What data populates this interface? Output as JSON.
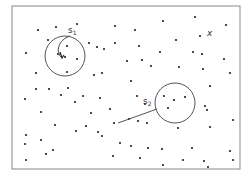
{
  "diagram": {
    "frame": {
      "x": 12,
      "y": 6,
      "width": 228,
      "height": 163
    },
    "colors": {
      "dot": "#222222",
      "line": "#777777",
      "background": "#ffffff"
    },
    "circles": [
      {
        "id": "s1",
        "label": "s",
        "subscript": "1",
        "cx": 65,
        "cy": 56,
        "r": 20,
        "label_x": 68,
        "label_y": 33
      },
      {
        "id": "s2",
        "label": "s",
        "subscript": "2",
        "cx": 175,
        "cy": 103,
        "r": 20,
        "label_x": 143,
        "label_y": 104
      }
    ],
    "marker": {
      "symbol": "×",
      "label": "x",
      "x": 207,
      "y": 36
    },
    "points": [
      [
        38,
        30
      ],
      [
        56,
        27
      ],
      [
        77,
        24
      ],
      [
        48,
        40
      ],
      [
        26,
        53
      ],
      [
        67,
        46
      ],
      [
        58,
        54
      ],
      [
        65,
        57
      ],
      [
        77,
        59
      ],
      [
        89,
        43
      ],
      [
        97,
        47
      ],
      [
        115,
        26
      ],
      [
        115,
        43
      ],
      [
        67,
        72
      ],
      [
        36,
        73
      ],
      [
        49,
        89
      ],
      [
        36,
        89
      ],
      [
        68,
        88
      ],
      [
        102,
        73
      ],
      [
        104,
        49
      ],
      [
        94,
        75
      ],
      [
        163,
        21
      ],
      [
        195,
        17
      ],
      [
        226,
        25
      ],
      [
        135,
        30
      ],
      [
        176,
        40
      ],
      [
        200,
        36
      ],
      [
        139,
        46
      ],
      [
        160,
        52
      ],
      [
        193,
        52
      ],
      [
        202,
        54
      ],
      [
        127,
        61
      ],
      [
        142,
        60
      ],
      [
        224,
        59
      ],
      [
        151,
        66
      ],
      [
        179,
        67
      ],
      [
        203,
        69
      ],
      [
        131,
        81
      ],
      [
        137,
        96
      ],
      [
        164,
        96
      ],
      [
        185,
        97
      ],
      [
        205,
        106
      ],
      [
        230,
        73
      ],
      [
        210,
        86
      ],
      [
        207,
        110
      ],
      [
        233,
        120
      ],
      [
        61,
        95
      ],
      [
        83,
        96
      ],
      [
        100,
        98
      ],
      [
        25,
        99
      ],
      [
        75,
        102
      ],
      [
        110,
        109
      ],
      [
        91,
        113
      ],
      [
        145,
        104
      ],
      [
        174,
        100
      ],
      [
        168,
        108
      ],
      [
        26,
        135
      ],
      [
        41,
        140
      ],
      [
        76,
        131
      ],
      [
        86,
        126
      ],
      [
        98,
        132
      ],
      [
        102,
        136
      ],
      [
        114,
        123
      ],
      [
        147,
        123
      ],
      [
        178,
        128
      ],
      [
        210,
        127
      ],
      [
        129,
        119
      ],
      [
        138,
        121
      ],
      [
        41,
        112
      ],
      [
        55,
        125
      ],
      [
        25,
        144
      ],
      [
        120,
        143
      ],
      [
        46,
        154
      ],
      [
        26,
        160
      ],
      [
        113,
        156
      ],
      [
        140,
        158
      ],
      [
        162,
        149
      ],
      [
        192,
        148
      ],
      [
        230,
        151
      ],
      [
        233,
        160
      ],
      [
        163,
        165
      ],
      [
        183,
        160
      ],
      [
        204,
        161
      ],
      [
        208,
        167
      ],
      [
        148,
        148
      ],
      [
        131,
        146
      ],
      [
        53,
        150
      ]
    ],
    "s1_arc": {
      "description": "curved pointer arc inside circle s1 from label toward center"
    },
    "s2_line": {
      "x1": 118,
      "y1": 123,
      "x2": 157,
      "y2": 109
    }
  }
}
